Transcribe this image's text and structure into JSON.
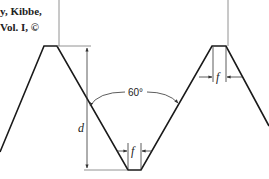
{
  "caption": {
    "line1": "y, Kibbe,",
    "line2": "Vol. I, ©"
  },
  "diagram": {
    "labels": {
      "depth": "d",
      "flat_root": "f",
      "flat_crest": "f",
      "angle": "60°"
    },
    "colors": {
      "line": "#1a1a1a",
      "dimension": "#555555",
      "background": "#ffffff"
    }
  }
}
